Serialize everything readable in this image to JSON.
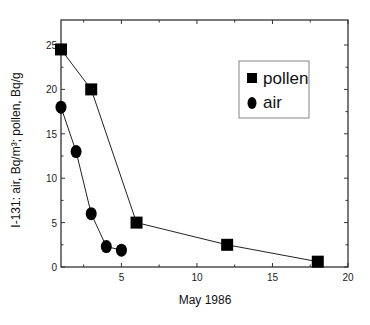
{
  "chart_data": {
    "type": "line",
    "title": "",
    "xlabel": "May 1986",
    "ylabel": "I-131: air, Bq/m³;   pollen, Bq/g",
    "xlim": [
      1,
      20
    ],
    "ylim": [
      0,
      27
    ],
    "x_ticks": [
      5,
      10,
      15,
      20
    ],
    "y_ticks": [
      0,
      5,
      10,
      15,
      20,
      25
    ],
    "grid": false,
    "legend_position": "upper right (inside)",
    "series": [
      {
        "name": "pollen",
        "marker": "square",
        "x": [
          1,
          3,
          6,
          12,
          18
        ],
        "values": [
          24.5,
          20,
          5,
          2.5,
          0.6
        ]
      },
      {
        "name": "air",
        "marker": "circle",
        "x": [
          1,
          2,
          3,
          4,
          5
        ],
        "values": [
          18,
          13,
          6,
          2.3,
          1.9
        ]
      }
    ]
  },
  "axes": {
    "xlabel": "May 1986",
    "ylabel": "I-131: air, Bq/m³;   pollen, Bq/g",
    "x_tick_labels": [
      "5",
      "10",
      "15",
      "20"
    ],
    "y_tick_labels": [
      "0",
      "5",
      "10",
      "15",
      "20",
      "25"
    ]
  },
  "legend": {
    "items": [
      {
        "label": "pollen",
        "marker": "square"
      },
      {
        "label": "air",
        "marker": "circle"
      }
    ]
  }
}
